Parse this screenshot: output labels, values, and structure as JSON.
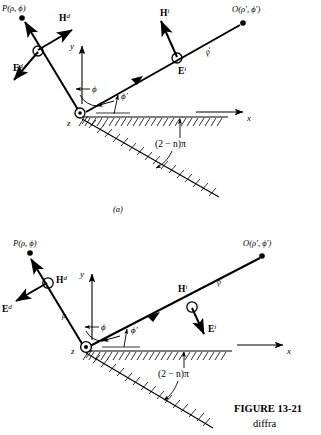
{
  "figure": {
    "number_label": "FIGURE  13-21",
    "caption_fragment": "diffra",
    "panel_a_label": "(a)",
    "panel_b_label": ""
  },
  "panels": [
    {
      "id": "panel-a",
      "label": "(a)",
      "points": {
        "observation_point": "P(ρ, ϕ)",
        "source_point": "O(ρ′, ϕ′)"
      },
      "axes": {
        "x_label": "x",
        "y_label": "y",
        "z_label": "z"
      },
      "rays": {
        "incident_length_label": "ρ′",
        "diffracted_length_label": ""
      },
      "angles": {
        "diffraction_angle": "ϕ",
        "incidence_angle": "ϕ′",
        "wedge_angle": "(2 − n)π"
      },
      "fields": {
        "diffracted_E": "E",
        "diffracted_E_sup": "d",
        "diffracted_H": "H",
        "diffracted_H_sup": "d",
        "incident_E": "E",
        "incident_E_sup": "i",
        "incident_H": "H",
        "incident_H_sup": "i"
      }
    },
    {
      "id": "panel-b",
      "label": "",
      "points": {
        "observation_point": "P(ρ, ϕ)",
        "source_point": "O(ρ′, ϕ′)"
      },
      "axes": {
        "x_label": "x",
        "y_label": "y",
        "z_label": "z"
      },
      "rays": {
        "incident_length_label": "ρ′",
        "diffracted_length_label": "ρ"
      },
      "angles": {
        "diffraction_angle": "ϕ",
        "incidence_angle": "ϕ′",
        "wedge_angle": "(2 − n)π"
      },
      "fields": {
        "diffracted_E": "E",
        "diffracted_E_sup": "d",
        "diffracted_H": "H",
        "diffracted_H_sup": "d",
        "incident_E": "E",
        "incident_E_sup": "i",
        "incident_H": "H",
        "incident_H_sup": "i"
      }
    }
  ],
  "colors": {
    "ink": "#000000",
    "background": "#ffffff"
  }
}
